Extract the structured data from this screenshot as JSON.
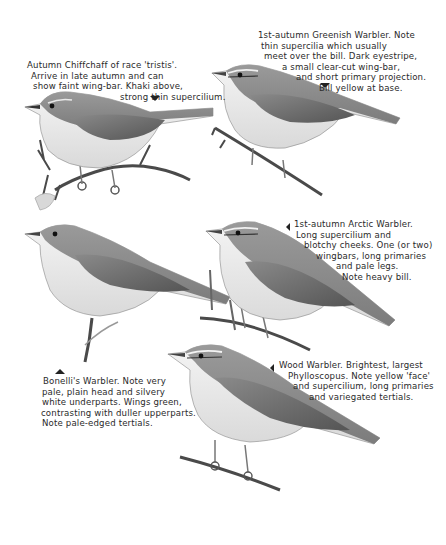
{
  "plate": {
    "species": [
      {
        "id": "chiffchaff",
        "name": "Autumn Chiffchaff of race 'tristis'",
        "pointer": "down",
        "caption_lines": [
          "Autumn Chiffchaff of race 'tristis'.",
          "Arrive in late autumn and can",
          "show faint wing-bar. Khaki above,",
          "strong thin supercilium."
        ]
      },
      {
        "id": "greenish-warbler",
        "name": "1st-autumn Greenish Warbler",
        "pointer": "down",
        "caption_lines": [
          "1st-autumn Greenish Warbler. Note",
          "thin supercilia  which usually",
          "meet  over the bill. Dark eyestripe,",
          "a small clear-cut wing-bar,",
          "and short primary projection.",
          "Bill yellow at base."
        ]
      },
      {
        "id": "arctic-warbler",
        "name": "1st-autumn Arctic Warbler",
        "pointer": "left",
        "caption_lines": [
          "1st-autumn Arctic Warbler.",
          "Long supercilium and",
          "blotchy cheeks. One (or two)",
          "wingbars, long primaries",
          "and pale legs.",
          "Note heavy bill."
        ]
      },
      {
        "id": "bonellis-warbler",
        "name": "Bonelli's Warbler",
        "pointer": "up",
        "caption_lines": [
          "Bonelli's Warbler. Note very",
          "pale, plain head and silvery",
          "white underparts. Wings green,",
          "contrasting with duller upperparts.",
          "Note pale-edged tertials."
        ]
      },
      {
        "id": "wood-warbler",
        "name": "Wood Warbler",
        "pointer": "left",
        "caption_lines": [
          "Wood Warbler. Brightest, largest",
          "Phylloscopus. Note yellow 'face'",
          "and  supercilium, long primaries",
          "and variegated tertials."
        ]
      }
    ]
  },
  "colors": {
    "background": "#ffffff",
    "text": "#2a2a2a",
    "bird_upperparts": "#8e8e8e",
    "bird_wing": "#6f6f6f",
    "bird_underparts": "#efefef",
    "branch": "#4a4a4a"
  }
}
